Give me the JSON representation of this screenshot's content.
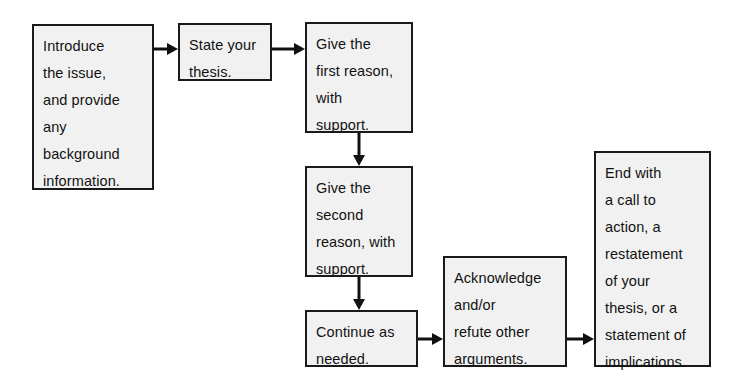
{
  "diagram": {
    "type": "flowchart",
    "canvas": {
      "width": 750,
      "height": 387
    },
    "style": {
      "box_fill": "#f1f1f1",
      "box_border": "#1a1a1a",
      "text_color": "#111111",
      "arrow_color": "#111111",
      "background": "#ffffff"
    },
    "nodes": [
      {
        "id": "node-introduce",
        "name": "introduce-the-issue",
        "text": "Introduce\nthe issue,\nand provide\nany\nbackground\ninformation.",
        "x": 32,
        "y": 24,
        "width": 122,
        "height": 166
      },
      {
        "id": "node-thesis",
        "name": "state-your-thesis",
        "text": "State your\nthesis.",
        "x": 178,
        "y": 23,
        "width": 94,
        "height": 58
      },
      {
        "id": "node-first-reason",
        "name": "give-first-reason",
        "text": "Give the\nfirst reason,\nwith\nsupport.",
        "x": 305,
        "y": 22,
        "width": 108,
        "height": 111
      },
      {
        "id": "node-second-reason",
        "name": "give-second-reason",
        "text": "Give the\nsecond\nreason, with\nsupport.",
        "x": 305,
        "y": 166,
        "width": 108,
        "height": 111
      },
      {
        "id": "node-continue",
        "name": "continue-as-needed",
        "text": "Continue as\nneeded.",
        "x": 305,
        "y": 310,
        "width": 113,
        "height": 57
      },
      {
        "id": "node-acknowledge",
        "name": "acknowledge-refute",
        "text": "Acknowledge\nand/or\nrefute other\narguments.",
        "x": 443,
        "y": 256,
        "width": 124,
        "height": 111
      },
      {
        "id": "node-end",
        "name": "end-with-call-to-action",
        "text": "End with\na call to\naction, a\nrestatement\nof your\nthesis, or a\nstatement of\nimplications.",
        "x": 594,
        "y": 151,
        "width": 117,
        "height": 216
      }
    ],
    "arrows": [
      {
        "id": "arrow-1",
        "name": "arrow-introduce-to-thesis",
        "from": "node-introduce",
        "to": "node-thesis",
        "direction": "right",
        "x": 154,
        "y": 41,
        "length": 24
      },
      {
        "id": "arrow-2",
        "name": "arrow-thesis-to-first-reason",
        "from": "node-thesis",
        "to": "node-first-reason",
        "direction": "right",
        "x": 272,
        "y": 41,
        "length": 33
      },
      {
        "id": "arrow-3",
        "name": "arrow-first-to-second-reason",
        "from": "node-first-reason",
        "to": "node-second-reason",
        "direction": "down",
        "x": 351,
        "y": 133,
        "length": 33
      },
      {
        "id": "arrow-4",
        "name": "arrow-second-reason-to-continue",
        "from": "node-second-reason",
        "to": "node-continue",
        "direction": "down",
        "x": 351,
        "y": 277,
        "length": 33
      },
      {
        "id": "arrow-5",
        "name": "arrow-continue-to-acknowledge",
        "from": "node-continue",
        "to": "node-acknowledge",
        "direction": "right",
        "x": 418,
        "y": 331,
        "length": 25
      },
      {
        "id": "arrow-6",
        "name": "arrow-acknowledge-to-end",
        "from": "node-acknowledge",
        "to": "node-end",
        "direction": "right",
        "x": 567,
        "y": 331,
        "length": 27
      }
    ]
  }
}
